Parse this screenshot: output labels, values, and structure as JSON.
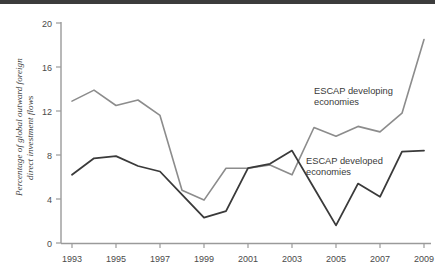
{
  "figure": {
    "background_color": "#ffffff",
    "top_band_color": "#3c3c3c"
  },
  "axes": {
    "y_axis_title": "Percentage of global outward foreign direct investment flows",
    "y_ticks": [
      "0",
      "4",
      "8",
      "12",
      "16",
      "20"
    ],
    "x_ticks": [
      "1993",
      "1995",
      "1997",
      "1999",
      "2001",
      "2003",
      "2005",
      "2007",
      "2009"
    ],
    "axis_color": "#9a9a9a"
  },
  "annotations": {
    "developing": {
      "line1": "ESCAP developing",
      "line2": "economies"
    },
    "developed": {
      "line1": "ESCAP developed",
      "line2": "economies"
    }
  },
  "chart_data": {
    "type": "line",
    "title": "",
    "xlabel": "",
    "ylabel": "Percentage of global outward foreign direct investment flows",
    "xlim": [
      1993,
      2009
    ],
    "ylim": [
      0,
      20
    ],
    "ytick_step": 4,
    "grid": false,
    "legend_position": "inline-annotations",
    "x": [
      1993,
      1994,
      1995,
      1996,
      1997,
      1998,
      1999,
      2000,
      2001,
      2002,
      2003,
      2004,
      2005,
      2006,
      2007,
      2008,
      2009
    ],
    "series": [
      {
        "name": "ESCAP developing economies",
        "color": "#8c8c8c",
        "line_width": 1.6,
        "values": [
          12.9,
          13.9,
          12.5,
          13.0,
          11.6,
          4.8,
          3.9,
          6.8,
          6.8,
          7.1,
          6.2,
          10.5,
          9.7,
          10.6,
          10.1,
          11.8,
          18.5
        ]
      },
      {
        "name": "ESCAP developed economies",
        "color": "#3a3a3a",
        "line_width": 1.8,
        "values": [
          6.2,
          7.7,
          7.9,
          7.0,
          6.5,
          4.4,
          2.3,
          2.9,
          6.8,
          7.2,
          8.4,
          5.0,
          1.6,
          5.4,
          4.2,
          8.3,
          8.4
        ]
      }
    ]
  }
}
